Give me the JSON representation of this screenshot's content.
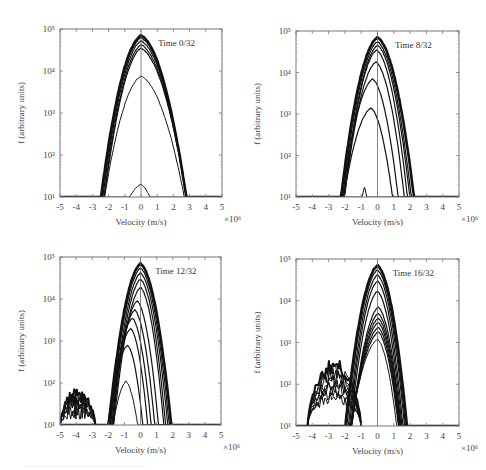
{
  "figure": {
    "xlabel": "Velocity (m/s)",
    "ylabel": "f (arbitrary units)",
    "x_multiplier": "×10⁶",
    "x_ticks": [
      -5,
      -4,
      -3,
      -2,
      -1,
      0,
      1,
      2,
      3,
      4,
      5
    ],
    "y_ticks": [
      "10¹",
      "10²",
      "10³",
      "10⁴",
      "10⁵"
    ],
    "colors": {
      "curve": "#111111",
      "frame": "#777777",
      "text": "#444444"
    }
  },
  "chart_data": [
    {
      "type": "line",
      "title": "Time 0/32",
      "xlabel": "Velocity (m/s)",
      "ylabel": "f (arbitrary units)",
      "xlim": [
        -5,
        5
      ],
      "x_scale_note": "×10⁶",
      "ylim": [
        10,
        100000
      ],
      "yscale": "log",
      "frame": {
        "x0": 60,
        "y0": 29,
        "x1": 222,
        "y1": 197
      },
      "series": [
        {
          "name": "c1",
          "peak": 70000,
          "center": 0.0,
          "wl": 0.75,
          "wr": 0.85,
          "lw": 2.6
        },
        {
          "name": "c2",
          "peak": 62000,
          "center": 0.0,
          "wl": 0.74,
          "wr": 0.86,
          "lw": 1.2
        },
        {
          "name": "c3",
          "peak": 52000,
          "center": 0.0,
          "wl": 0.73,
          "wr": 0.87,
          "lw": 1.2
        },
        {
          "name": "c4",
          "peak": 42000,
          "center": 0.0,
          "wl": 0.72,
          "wr": 0.88,
          "lw": 1.2
        },
        {
          "name": "c5",
          "peak": 35000,
          "center": 0.0,
          "wl": 0.72,
          "wr": 0.89,
          "lw": 1.2
        },
        {
          "name": "c6",
          "peak": 7500,
          "center": 0.0,
          "wl": 0.8,
          "wr": 0.95,
          "lw": 1.0
        },
        {
          "name": "c7",
          "peak": 20,
          "center": 0.0,
          "wl": 0.9,
          "wr": 0.7,
          "lw": 1.0
        }
      ]
    },
    {
      "type": "line",
      "title": "Time 8/32",
      "xlabel": "Velocity (m/s)",
      "ylabel": "f (arbitrary units)",
      "xlim": [
        -5,
        5
      ],
      "x_scale_note": "×10⁶",
      "ylim": [
        10,
        100000
      ],
      "yscale": "log",
      "frame": {
        "x0": 296,
        "y0": 31,
        "x1": 459,
        "y1": 197
      },
      "series": [
        {
          "name": "c1",
          "peak": 70000,
          "center": 0.0,
          "wl": 0.68,
          "wr": 0.68,
          "lw": 2.6
        },
        {
          "name": "c2",
          "peak": 55000,
          "center": 0.0,
          "wl": 0.66,
          "wr": 0.64,
          "lw": 1.2
        },
        {
          "name": "c3",
          "peak": 45000,
          "center": 0.0,
          "wl": 0.64,
          "wr": 0.62,
          "lw": 1.2
        },
        {
          "name": "c4",
          "peak": 35000,
          "center": -0.05,
          "wl": 0.63,
          "wr": 0.6,
          "lw": 1.2
        },
        {
          "name": "c5",
          "peak": 18000,
          "center": -0.1,
          "wl": 0.64,
          "wr": 0.58,
          "lw": 1.2
        },
        {
          "name": "c6",
          "peak": 7000,
          "center": -0.3,
          "wl": 0.66,
          "wr": 0.56,
          "lw": 1.2
        },
        {
          "name": "c7",
          "peak": 1400,
          "center": -0.4,
          "wl": 0.7,
          "wr": 0.55,
          "lw": 1.2
        },
        {
          "name": "c8",
          "peak": 17,
          "center": -0.8,
          "wl": 0.2,
          "wr": 0.2,
          "lw": 1.0
        }
      ]
    },
    {
      "type": "line",
      "title": "Time 12/32",
      "xlabel": "Velocity (m/s)",
      "ylabel": "f (arbitrary units)",
      "xlim": [
        -5,
        5
      ],
      "x_scale_note": "×10⁶",
      "ylim": [
        10,
        100000
      ],
      "yscale": "log",
      "frame": {
        "x0": 60,
        "y0": 257,
        "x1": 221,
        "y1": 425
      },
      "series": [
        {
          "name": "c1",
          "peak": 70000,
          "center": 0.0,
          "wl": 0.6,
          "wr": 0.58,
          "lw": 2.6
        },
        {
          "name": "c2",
          "peak": 55000,
          "center": 0.0,
          "wl": 0.58,
          "wr": 0.55,
          "lw": 1.2
        },
        {
          "name": "c3",
          "peak": 42000,
          "center": 0.0,
          "wl": 0.56,
          "wr": 0.53,
          "lw": 1.2
        },
        {
          "name": "c4",
          "peak": 30000,
          "center": 0.0,
          "wl": 0.55,
          "wr": 0.5,
          "lw": 1.2
        },
        {
          "name": "c5",
          "peak": 19000,
          "center": 0.0,
          "wl": 0.55,
          "wr": 0.48,
          "lw": 1.2
        },
        {
          "name": "c6",
          "peak": 9000,
          "center": -0.2,
          "wl": 0.55,
          "wr": 0.46,
          "lw": 1.2
        },
        {
          "name": "c7",
          "peak": 5500,
          "center": -0.35,
          "wl": 0.55,
          "wr": 0.45,
          "lw": 1.2
        },
        {
          "name": "c8",
          "peak": 3500,
          "center": -0.5,
          "wl": 0.55,
          "wr": 0.44,
          "lw": 1.2
        },
        {
          "name": "c9",
          "peak": 2000,
          "center": -0.6,
          "wl": 0.55,
          "wr": 0.42,
          "lw": 1.2
        },
        {
          "name": "c10",
          "peak": 800,
          "center": -0.8,
          "wl": 0.55,
          "wr": 0.42,
          "lw": 1.2
        },
        {
          "name": "c11",
          "peak": 110,
          "center": -0.9,
          "wl": 0.5,
          "wr": 0.45,
          "lw": 1.0
        }
      ],
      "tail": {
        "x_range": [
          -5,
          -2.8
        ],
        "peak_values": [
          60,
          50,
          45,
          40,
          35,
          30,
          25,
          20
        ]
      }
    },
    {
      "type": "line",
      "title": "Time 16/32",
      "xlabel": "Velocity (m/s)",
      "ylabel": "f (arbitrary units)",
      "xlim": [
        -5,
        5
      ],
      "x_scale_note": "×10⁶",
      "ylim": [
        10,
        100000
      ],
      "yscale": "log",
      "frame": {
        "x0": 296,
        "y0": 259,
        "x1": 459,
        "y1": 426
      },
      "series": [
        {
          "name": "c1",
          "peak": 70000,
          "center": 0.0,
          "wl": 0.6,
          "wr": 0.55,
          "lw": 2.6
        },
        {
          "name": "c2",
          "peak": 55000,
          "center": 0.0,
          "wl": 0.58,
          "wr": 0.53,
          "lw": 1.2
        },
        {
          "name": "c3",
          "peak": 42000,
          "center": 0.0,
          "wl": 0.56,
          "wr": 0.52,
          "lw": 1.2
        },
        {
          "name": "c4",
          "peak": 30000,
          "center": 0.0,
          "wl": 0.55,
          "wr": 0.5,
          "lw": 1.2
        },
        {
          "name": "c5",
          "peak": 17000,
          "center": 0.0,
          "wl": 0.55,
          "wr": 0.5,
          "lw": 1.2
        },
        {
          "name": "c6",
          "peak": 7000,
          "center": 0.05,
          "wl": 0.58,
          "wr": 0.5,
          "lw": 1.2
        },
        {
          "name": "c7",
          "peak": 5000,
          "center": 0.05,
          "wl": 0.6,
          "wr": 0.5,
          "lw": 1.2
        },
        {
          "name": "c8",
          "peak": 3800,
          "center": 0.05,
          "wl": 0.62,
          "wr": 0.5,
          "lw": 1.2
        },
        {
          "name": "c9",
          "peak": 3000,
          "center": 0.05,
          "wl": 0.64,
          "wr": 0.5,
          "lw": 1.2
        },
        {
          "name": "c10",
          "peak": 2300,
          "center": 0.05,
          "wl": 0.66,
          "wr": 0.5,
          "lw": 1.2
        },
        {
          "name": "c11",
          "peak": 1800,
          "center": 0.05,
          "wl": 0.68,
          "wr": 0.5,
          "lw": 1.2
        },
        {
          "name": "c12",
          "peak": 1200,
          "center": 0.0,
          "wl": 0.7,
          "wr": 0.5,
          "lw": 1.0
        }
      ],
      "tail": {
        "x_range": [
          -4.3,
          -1.0
        ],
        "peak_values": [
          280,
          220,
          180,
          150,
          120,
          100,
          80,
          60,
          50
        ]
      }
    }
  ]
}
